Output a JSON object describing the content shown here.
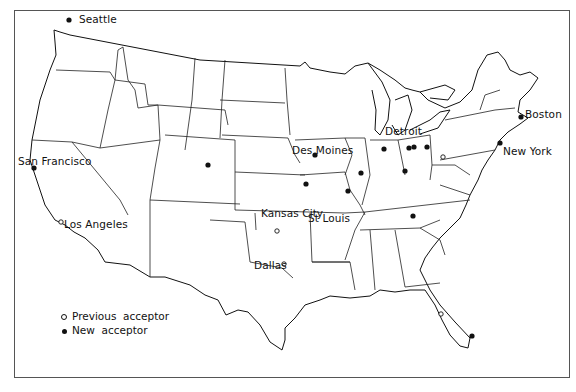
{
  "map": {
    "title": "",
    "region": "Contiguous United States",
    "cities": [
      {
        "name": "Seattle",
        "label_x": 79,
        "label_y": 14,
        "marker": "new",
        "x": 69,
        "y": 20
      },
      {
        "name": "San Francisco",
        "label_x": 18,
        "label_y": 156,
        "marker": "new",
        "x": 34,
        "y": 168
      },
      {
        "name": "Los Angeles",
        "label_x": 64,
        "label_y": 219,
        "marker": "previous",
        "x": 61,
        "y": 222
      },
      {
        "name": "Des Moines",
        "label_x": 292,
        "label_y": 145,
        "marker": "new",
        "x": 315,
        "y": 155
      },
      {
        "name": "Kansas City",
        "label_x": 261,
        "label_y": 208,
        "marker": "new",
        "x": 306,
        "y": 184
      },
      {
        "name": "St Louis",
        "label_x": 308,
        "label_y": 213,
        "marker": "new",
        "x": 348,
        "y": 191
      },
      {
        "name": "Detroit",
        "label_x": 385,
        "label_y": 126,
        "marker": "new",
        "x": 414,
        "y": 147
      },
      {
        "name": "Boston",
        "label_x": 525,
        "label_y": 109,
        "marker": "new",
        "x": 521,
        "y": 117
      },
      {
        "name": "New York",
        "label_x": 503,
        "label_y": 146,
        "marker": "new",
        "x": 500,
        "y": 143
      },
      {
        "name": "Dallas",
        "label_x": 254,
        "label_y": 260,
        "marker": "previous",
        "x": 284,
        "y": 264
      }
    ],
    "unlabeled_markers": [
      {
        "x": 208,
        "y": 165,
        "marker": "new"
      },
      {
        "x": 361,
        "y": 173,
        "marker": "new"
      },
      {
        "x": 384,
        "y": 149,
        "marker": "new"
      },
      {
        "x": 409,
        "y": 148,
        "marker": "new"
      },
      {
        "x": 427,
        "y": 147,
        "marker": "new"
      },
      {
        "x": 405,
        "y": 171,
        "marker": "new"
      },
      {
        "x": 443,
        "y": 157,
        "marker": "previous"
      },
      {
        "x": 413,
        "y": 216,
        "marker": "new"
      },
      {
        "x": 277,
        "y": 231,
        "marker": "previous"
      },
      {
        "x": 472,
        "y": 336,
        "marker": "new"
      },
      {
        "x": 441,
        "y": 314,
        "marker": "previous"
      }
    ]
  },
  "legend": {
    "items": [
      {
        "symbol": "previous",
        "label": "Previous  acceptor"
      },
      {
        "symbol": "new",
        "label": "New  acceptor"
      }
    ]
  },
  "colors": {
    "ink": "#111111",
    "background": "#ffffff"
  }
}
